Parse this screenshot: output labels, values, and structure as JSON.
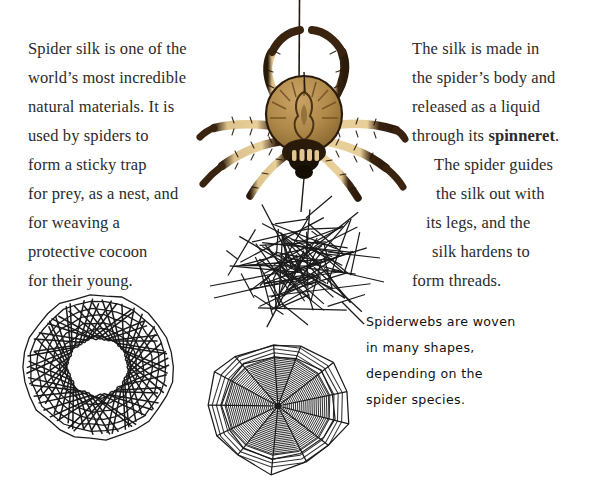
{
  "page": {
    "background_color": "#ffffff",
    "text_color": "#2b2b2b",
    "caption_color": "#111111",
    "width": 599,
    "height": 483
  },
  "left_paragraph": {
    "name": "spider-silk-intro-paragraph",
    "lines": [
      "Spider silk is one of the",
      "world’s most incredible",
      "natural materials. It is",
      "used by spiders to",
      "form a sticky trap",
      "for prey, as a nest, and",
      "for weaving a",
      "protective cocoon",
      "for their young."
    ],
    "full_text": "Spider silk is one of the world’s most incredible natural materials. It is used by spiders to form a sticky trap for prey, as a nest, and for weaving a protective cocoon for their young."
  },
  "right_paragraph": {
    "name": "silk-production-paragraph",
    "lines": [
      {
        "text": "The silk is made in",
        "bold_word": ""
      },
      {
        "text": "the spider’s body and",
        "bold_word": ""
      },
      {
        "text": "released as a liquid",
        "bold_word": ""
      },
      {
        "text": "through its ",
        "bold_word": "spinneret",
        "tail": "."
      },
      {
        "text": "The spider guides",
        "bold_word": ""
      },
      {
        "text": "the silk out with",
        "bold_word": ""
      },
      {
        "text": "its legs, and the",
        "bold_word": ""
      },
      {
        "text": "silk hardens to",
        "bold_word": ""
      },
      {
        "text": "form threads.",
        "bold_word": ""
      }
    ],
    "line_1": "The silk is made in",
    "line_2": "the spider’s body and",
    "line_3": "released as a liquid",
    "line_4_prefix": "through its ",
    "line_4_bold": "spinneret",
    "line_4_suffix": ".",
    "line_5": "The spider guides",
    "line_6": "the silk out with",
    "line_7": "its legs, and the",
    "line_8": "silk hardens to",
    "line_9": "form threads.",
    "full_text": "The silk is made in the spider’s body and released as a liquid through its spinneret. The spider guides the silk out with its legs, and the silk hardens to form threads."
  },
  "caption": {
    "name": "spiderweb-shapes-caption",
    "lines": [
      "Spiderwebs are woven",
      "in many shapes,",
      "depending on the",
      "spider species."
    ],
    "full_text": "Spiderwebs are woven in many shapes, depending on the spider species."
  },
  "illustrations": {
    "spider": {
      "name": "spider-illustration",
      "label": "spider hanging from silk thread",
      "body_color": "#b08a4a",
      "body_shade": "#8a6a33",
      "leg_light": "#e8cf9a",
      "leg_dark": "#3a2410",
      "outline_color": "#2a1a0a",
      "legs": 8
    },
    "silk_thread": {
      "name": "silk-thread",
      "label": "vertical silk thread above spider",
      "color": "#221a12"
    },
    "tangle_web": {
      "name": "tangled-web-illustration",
      "label": "irregular tangled cobweb",
      "line_color": "#1a1a1a"
    },
    "spiral_web": {
      "name": "spiral-ring-web-illustration",
      "label": "dense circular ring web with open centre",
      "line_color": "#1a1a1a",
      "hub_radius": 26,
      "chords": 46
    },
    "orb_web": {
      "name": "orb-web-illustration",
      "label": "classic orb web with radial spokes and spiral rings",
      "line_color": "#1a1a1a",
      "spokes": 13,
      "rings": 24
    }
  }
}
